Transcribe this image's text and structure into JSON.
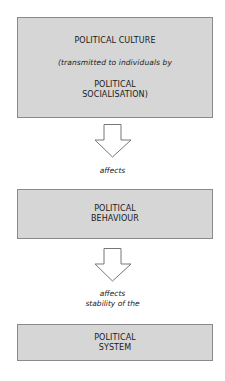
{
  "diagram": {
    "box1": {
      "title": "POLITICAL CULTURE",
      "subtitle": "(transmitted to individuals by",
      "line1": "POLITICAL",
      "line2": "SOCIALISATION)"
    },
    "arrow1_label": "affects",
    "box2": {
      "line1": "POLITICAL",
      "line2": "BEHAVIOUR"
    },
    "arrow2_label_line1": "affects",
    "arrow2_label_line2": "stability of the",
    "box3": {
      "line1": "POLITICAL",
      "line2": "SYSTEM"
    },
    "colors": {
      "box_fill": "#d6d6d6",
      "box_border": "#8a8a8a"
    }
  }
}
